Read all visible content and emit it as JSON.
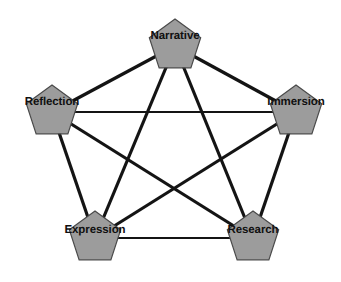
{
  "diagram": {
    "type": "network-graph",
    "shape": "complete-graph-k5",
    "background_color": "#ffffff",
    "canvas": {
      "width": 341,
      "height": 282
    },
    "node_style": {
      "shape": "pentagon",
      "fill_color": "#9c9c9c",
      "stroke_color": "#4a4a4a",
      "stroke_width": 1.2,
      "radius": 27
    },
    "edge_style": {
      "color": "#141414",
      "thick_width": 3.2,
      "thin_width": 1.9
    },
    "label_style": {
      "color": "#101010",
      "font_size": 11.5,
      "font_weight": "bold"
    },
    "nodes": [
      {
        "id": "narrative",
        "label": "Narrative",
        "x": 175,
        "y": 46,
        "label_x": 175,
        "label_y": 36
      },
      {
        "id": "reflection",
        "label": "Reflection",
        "x": 52,
        "y": 112,
        "label_x": 52,
        "label_y": 102
      },
      {
        "id": "immersion",
        "label": "Immersion",
        "x": 296,
        "y": 112,
        "label_x": 296,
        "label_y": 102
      },
      {
        "id": "expression",
        "label": "Expression",
        "x": 95,
        "y": 238,
        "label_x": 95,
        "label_y": 230
      },
      {
        "id": "research",
        "label": "Research",
        "x": 253,
        "y": 238,
        "label_x": 253,
        "label_y": 230
      }
    ],
    "edges": [
      {
        "id": "narrative-reflection",
        "from": "narrative",
        "to": "reflection",
        "weight": "thick"
      },
      {
        "id": "narrative-immersion",
        "from": "narrative",
        "to": "immersion",
        "weight": "thick"
      },
      {
        "id": "narrative-expression",
        "from": "narrative",
        "to": "expression",
        "weight": "thick"
      },
      {
        "id": "narrative-research",
        "from": "narrative",
        "to": "research",
        "weight": "thick"
      },
      {
        "id": "reflection-immersion",
        "from": "reflection",
        "to": "immersion",
        "weight": "thin"
      },
      {
        "id": "reflection-expression",
        "from": "reflection",
        "to": "expression",
        "weight": "thick"
      },
      {
        "id": "reflection-research",
        "from": "reflection",
        "to": "research",
        "weight": "thick"
      },
      {
        "id": "immersion-expression",
        "from": "immersion",
        "to": "expression",
        "weight": "thick"
      },
      {
        "id": "immersion-research",
        "from": "immersion",
        "to": "research",
        "weight": "thick"
      },
      {
        "id": "expression-research",
        "from": "expression",
        "to": "research",
        "weight": "thin"
      }
    ]
  }
}
